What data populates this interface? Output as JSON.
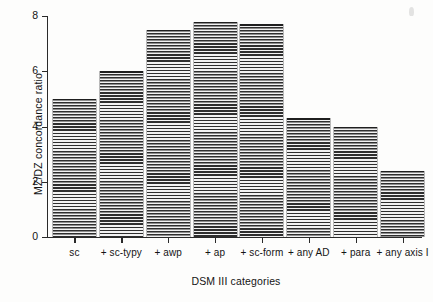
{
  "chart_data": {
    "type": "bar",
    "title": "",
    "subtitle": "",
    "xlabel": "DSM III categories",
    "ylabel": "MZ/DZ concordance ratio",
    "categories": [
      "sc",
      "+ sc-typy",
      "+ awp",
      "+ ap",
      "+ sc-form",
      "+ any AD",
      "+ para",
      "+ any axis I"
    ],
    "values": [
      5.0,
      6.0,
      7.5,
      7.8,
      7.7,
      4.3,
      4.0,
      2.4
    ],
    "ylim": [
      0,
      8
    ],
    "yticks": [
      0,
      2,
      4,
      6,
      8
    ],
    "ytick_labels": [
      "0",
      "2",
      "4",
      "6",
      "8"
    ],
    "grid": false,
    "legend": null,
    "bar_fill": "horizontal-line-hatch",
    "axis_color": "#2a2a2a",
    "text_color": "#141414",
    "background": "#fdfdfc"
  },
  "axes": {
    "y_title": "MZ/DZ concordance ratio",
    "x_title": "DSM III categories"
  }
}
